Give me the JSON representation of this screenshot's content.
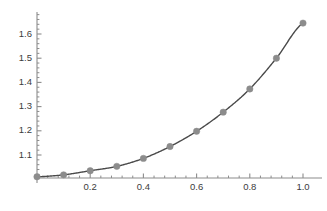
{
  "chart_data": {
    "type": "line",
    "title": "",
    "subtitle": "",
    "xlabel": "",
    "ylabel": "",
    "xlim": [
      -0.02,
      1.04
    ],
    "ylim": [
      0.995,
      1.675
    ],
    "grid": false,
    "legend": null,
    "marker_style": "filled-circle",
    "marker_color": "#8c8c8c",
    "line_color": "#4a4a4a",
    "axis_color": "#8c8c8c",
    "x_tick_labels": [
      "0.2",
      "0.4",
      "0.6",
      "0.8",
      "1.0"
    ],
    "x_tick_values": [
      0.2,
      0.4,
      0.6,
      0.8,
      1.0
    ],
    "x_minor_count": 4,
    "y_tick_labels": [
      "1.1",
      "1.2",
      "1.3",
      "1.4",
      "1.5",
      "1.6"
    ],
    "y_tick_values": [
      1.1,
      1.2,
      1.3,
      1.4,
      1.5,
      1.6
    ],
    "y_minor_count": 4,
    "series": [
      {
        "name": "curve",
        "x": [
          0.0,
          0.1,
          0.2,
          0.3,
          0.4,
          0.5,
          0.6,
          0.7,
          0.8,
          0.9,
          1.0
        ],
        "values": [
          1.01,
          1.018,
          1.035,
          1.053,
          1.086,
          1.135,
          1.198,
          1.277,
          1.373,
          1.5,
          1.645
        ]
      }
    ]
  }
}
